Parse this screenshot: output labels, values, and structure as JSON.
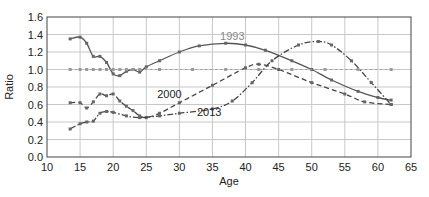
{
  "chart_data": {
    "type": "line",
    "title": "",
    "xlabel": "Age",
    "ylabel": "Ratio",
    "xlim": [
      10,
      65
    ],
    "ylim": [
      0.0,
      1.6
    ],
    "xticks": [
      10,
      15,
      20,
      25,
      30,
      35,
      40,
      45,
      50,
      55,
      60,
      65
    ],
    "yticks": [
      "0.0",
      "0.2",
      "0.4",
      "0.6",
      "0.8",
      "1.0",
      "1.2",
      "1.4",
      "1.6"
    ],
    "grid": true,
    "legend": "inline labels",
    "series": [
      {
        "name": "1993",
        "style": "solid",
        "color": "#555555",
        "label_pos": [
          38,
          1.38
        ],
        "label_color": "#888888",
        "x": [
          13.5,
          15,
          16,
          17,
          18,
          19,
          20,
          21,
          22,
          23,
          24,
          25,
          27,
          30,
          33,
          37,
          40,
          43,
          47,
          50,
          53,
          57,
          60,
          62
        ],
        "values": [
          1.35,
          1.37,
          1.3,
          1.15,
          1.15,
          1.08,
          0.95,
          0.93,
          0.98,
          1.0,
          0.97,
          1.03,
          1.1,
          1.2,
          1.27,
          1.3,
          1.28,
          1.22,
          1.1,
          1.0,
          0.88,
          0.75,
          0.68,
          0.65
        ]
      },
      {
        "name": "2000",
        "style": "dashed",
        "color": "#444444",
        "label_pos": [
          28.5,
          0.72
        ],
        "label_color": "#222222",
        "x": [
          13.5,
          15,
          16,
          17,
          18,
          19,
          20,
          21,
          22,
          23,
          24,
          25,
          27,
          30,
          35,
          40,
          42,
          45,
          50,
          55,
          58,
          62
        ],
        "values": [
          0.62,
          0.62,
          0.56,
          0.63,
          0.72,
          0.7,
          0.72,
          0.64,
          0.58,
          0.53,
          0.47,
          0.45,
          0.5,
          0.62,
          0.82,
          1.02,
          1.06,
          1.0,
          0.85,
          0.72,
          0.63,
          0.6
        ]
      },
      {
        "name": "2013",
        "style": "dash-dot",
        "color": "#444444",
        "label_pos": [
          34.5,
          0.52
        ],
        "label_color": "#222222",
        "x": [
          13.5,
          15,
          16,
          17,
          18,
          19,
          20,
          22,
          24,
          27,
          30,
          35,
          38,
          41,
          44,
          48,
          51,
          53,
          56,
          59,
          62
        ],
        "values": [
          0.32,
          0.38,
          0.4,
          0.41,
          0.5,
          0.52,
          0.51,
          0.47,
          0.45,
          0.47,
          0.5,
          0.55,
          0.64,
          0.85,
          1.1,
          1.28,
          1.32,
          1.28,
          1.1,
          0.85,
          0.6
        ]
      },
      {
        "name": "reference",
        "style": "dotted-markers",
        "color": "#999999",
        "x": [
          13.5,
          15,
          16,
          17,
          18,
          19,
          20,
          21,
          22,
          23,
          24,
          27,
          32,
          37,
          42,
          47,
          52,
          57,
          62
        ],
        "values": [
          1.0,
          1.0,
          1.0,
          1.0,
          1.0,
          1.0,
          1.0,
          1.0,
          1.0,
          1.0,
          1.0,
          1.0,
          1.0,
          1.0,
          1.0,
          1.0,
          1.0,
          1.0,
          1.0
        ]
      }
    ]
  },
  "colors": {
    "grid": "#c8c8c8",
    "axis": "#444444",
    "background": "#ffffff"
  }
}
